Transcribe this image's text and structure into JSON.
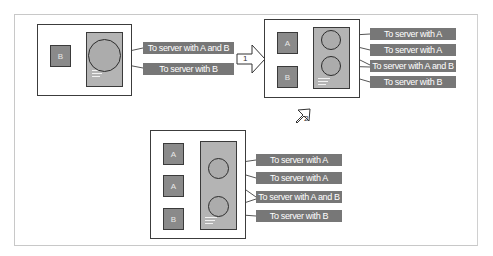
{
  "diagram": {
    "colors": {
      "host_border": "#3c3c3c",
      "client_fill": "#8a8a8a",
      "proxy_fill": "#b4b4b4",
      "label_fill": "#777777",
      "label_text": "#ffffff",
      "frame_border": "#c8c8c8"
    },
    "steps": [
      {
        "number": "1",
        "icon": "right-arrow-icon"
      },
      {
        "number": "2",
        "icon": "down-left-arrow-icon"
      }
    ],
    "stage1": {
      "clients": [
        "B"
      ],
      "pools": 1,
      "labels": [
        "To server with A and B",
        "To server with B"
      ]
    },
    "stage2": {
      "clients": [
        "A",
        "B"
      ],
      "pools": 2,
      "labels": [
        "To server with A",
        "To server with A",
        "To server with A and B",
        "To server with B"
      ]
    },
    "stage3": {
      "clients": [
        "A",
        "A",
        "B"
      ],
      "pools": 2,
      "labels": [
        "To server with A",
        "To server with A",
        "To server with A and B",
        "To server with B"
      ]
    }
  }
}
